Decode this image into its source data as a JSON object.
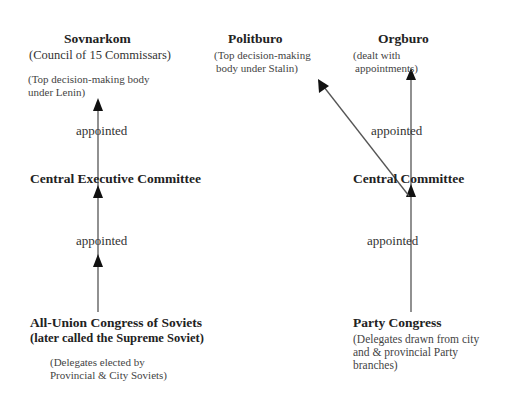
{
  "left_column": {
    "sovnarkom": {
      "title": "Sovnarkom",
      "subtitle": "(Council of 15 Commissars)",
      "note_line1": "(Top decision-making body",
      "note_line2": "under Lenin)"
    },
    "appointed_upper": "appointed",
    "central_executive_committee": {
      "title": "Central Executive Committee"
    },
    "appointed_lower": "appointed",
    "all_union_congress": {
      "title": "All-Union Congress of Soviets",
      "subtitle": "(later called the Supreme Soviet)",
      "note_line1": "(Delegates elected by",
      "note_line2": "Provincial & City Soviets)"
    }
  },
  "politburo": {
    "title": "Politburo",
    "note_line1": "(Top decision-making",
    "note_line2": "body under Stalin)"
  },
  "right_column": {
    "orgburo": {
      "title": "Orgburo",
      "note_line1": "(dealt with",
      "note_line2": "appointments)"
    },
    "appointed_upper": "appointed",
    "central_committee": {
      "title": "Central Committee"
    },
    "appointed_lower": "appointed",
    "party_congress": {
      "title": "Party Congress",
      "note_line1": "(Delegates drawn from city",
      "note_line2": "and & provincial Party",
      "note_line3": "branches)"
    }
  },
  "colors": {
    "line": "#555555",
    "arrowhead": "#111111",
    "text": "#2a2a2a"
  }
}
